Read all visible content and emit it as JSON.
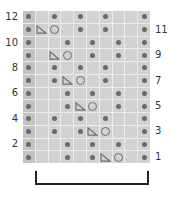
{
  "chart_data": {
    "type": "knitting-chart",
    "columns": 10,
    "rows": 12,
    "legend_symbols": {
      "dot": "purl",
      "triangle": "decrease",
      "circle": "yarn-over",
      "empty": "knit"
    },
    "row_numbers_left": [
      "12",
      "10",
      "8",
      "6",
      "4",
      "2"
    ],
    "row_numbers_right": [
      "11",
      "9",
      "7",
      "5",
      "3",
      "1"
    ],
    "grid": [
      {
        "row": 12,
        "cells": [
          "dot",
          "",
          "dot",
          "",
          "dot",
          "",
          "dot",
          "",
          "",
          "dot"
        ]
      },
      {
        "row": 11,
        "cells": [
          "dot",
          "triangle",
          "circle",
          "",
          "dot",
          "",
          "dot",
          "",
          "",
          "dot"
        ]
      },
      {
        "row": 10,
        "cells": [
          "dot",
          "",
          "",
          "dot",
          "",
          "dot",
          "",
          "dot",
          "",
          "dot"
        ]
      },
      {
        "row": 9,
        "cells": [
          "dot",
          "",
          "triangle",
          "circle",
          "",
          "dot",
          "",
          "dot",
          "",
          "dot"
        ]
      },
      {
        "row": 8,
        "cells": [
          "dot",
          "",
          "dot",
          "",
          "dot",
          "",
          "dot",
          "",
          "",
          "dot"
        ]
      },
      {
        "row": 7,
        "cells": [
          "dot",
          "",
          "dot",
          "triangle",
          "circle",
          "",
          "dot",
          "",
          "",
          "dot"
        ]
      },
      {
        "row": 6,
        "cells": [
          "dot",
          "",
          "",
          "dot",
          "",
          "dot",
          "",
          "dot",
          "",
          "dot"
        ]
      },
      {
        "row": 5,
        "cells": [
          "dot",
          "",
          "",
          "dot",
          "triangle",
          "circle",
          "",
          "dot",
          "",
          "dot"
        ]
      },
      {
        "row": 4,
        "cells": [
          "dot",
          "",
          "dot",
          "",
          "dot",
          "",
          "dot",
          "",
          "",
          "dot"
        ]
      },
      {
        "row": 3,
        "cells": [
          "dot",
          "",
          "dot",
          "",
          "dot",
          "triangle",
          "circle",
          "",
          "",
          "dot"
        ]
      },
      {
        "row": 2,
        "cells": [
          "dot",
          "",
          "",
          "dot",
          "",
          "dot",
          "",
          "dot",
          "",
          "dot"
        ]
      },
      {
        "row": 1,
        "cells": [
          "dot",
          "",
          "",
          "dot",
          "",
          "dot",
          "triangle",
          "circle",
          "",
          "dot"
        ]
      }
    ],
    "repeat_bracket": {
      "from_column": 2,
      "to_column": 9
    }
  },
  "colors": {
    "cell": "#d2d2d2",
    "edge_cell": "#c3c3c3",
    "grid_line": "#ebebeb",
    "symbol": "#6a6a6a",
    "bracket": "#222222"
  }
}
